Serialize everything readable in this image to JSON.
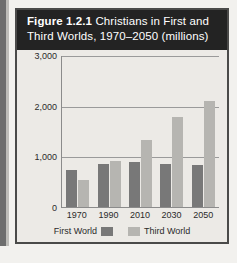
{
  "figure": {
    "caption_label": "Figure 1.2.1",
    "caption_text": "Christians in First and Third Worlds, 1970–2050 (millions)"
  },
  "colors": {
    "first_world": "#787878",
    "third_world": "#b6b5b1",
    "banner": "#232323",
    "frame": "#4a4a49",
    "plot_background": "#eceae6"
  },
  "chart_data": {
    "type": "bar",
    "title": "Figure 1.2.1 Christians in First and Third Worlds, 1970–2050 (millions)",
    "xlabel": "",
    "ylabel": "",
    "categories": [
      "1970",
      "1990",
      "2010",
      "2030",
      "2050"
    ],
    "series": [
      {
        "name": "First World",
        "values": [
          725,
          840,
          880,
          840,
          825
        ]
      },
      {
        "name": "Third World",
        "values": [
          530,
          900,
          1330,
          1770,
          2100
        ]
      }
    ],
    "ylim": [
      0,
      3000
    ],
    "yticks": [
      0,
      1000,
      2000,
      3000
    ],
    "ytick_labels": [
      "0",
      "1,000",
      "2,000",
      "3,000"
    ],
    "grid": true,
    "legend_position": "bottom",
    "legend": [
      "First World",
      "Third World"
    ]
  }
}
